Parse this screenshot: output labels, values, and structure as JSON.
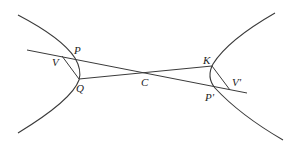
{
  "diagram": {
    "labels": {
      "P": "P",
      "V": "V",
      "Q": "Q",
      "C": "C",
      "K": "K",
      "V_prime": "V'",
      "P_prime": "P'"
    },
    "points": {
      "P": [
        76,
        58
      ],
      "V": [
        61,
        56
      ],
      "Q": [
        79,
        79
      ],
      "C": [
        145,
        73
      ],
      "K": [
        212,
        66
      ],
      "V_prime": [
        231,
        90
      ],
      "P_prime": [
        216,
        88
      ]
    },
    "stroke_color": "#3a3a3a",
    "background": "#ffffff"
  }
}
